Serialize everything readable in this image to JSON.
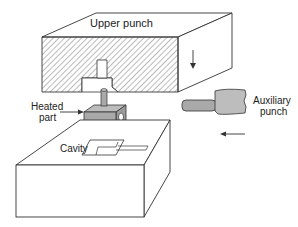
{
  "diagram": {
    "type": "technical-illustration",
    "labels": {
      "upper_punch": "Upper punch",
      "heated_part_line1": "Heated",
      "heated_part_line2": "part",
      "cavity": "Cavity",
      "auxiliary_line1": "Auxiliary",
      "auxiliary_line2": "punch"
    },
    "arrows": {
      "upper_punch_motion": "down",
      "auxiliary_punch_motion": "left"
    },
    "colors": {
      "line": "#333333",
      "part_fill": "#a9a9a9",
      "hatch": "#555555",
      "background": "#ffffff"
    }
  }
}
